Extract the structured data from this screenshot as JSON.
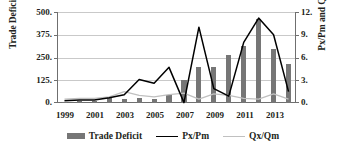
{
  "chart_data": {
    "type": "bar",
    "title": "",
    "xlabel": "",
    "ylabel": "Trade Deficit",
    "y2label": "Px/Pm and Qx/Qm",
    "ylim": [
      0,
      500
    ],
    "y2lim": [
      0,
      12
    ],
    "grid": true,
    "legend_position": "bottom",
    "categories": [
      "1999",
      "2000",
      "2001",
      "2002",
      "2003",
      "2004",
      "2005",
      "2006",
      "2007",
      "2008",
      "2009",
      "2010",
      "2011",
      "2012",
      "2013",
      "2014"
    ],
    "x_tick_labels": [
      "1999",
      "2001",
      "2003",
      "2005",
      "2007",
      "2009",
      "2011",
      "2013"
    ],
    "y_tick_labels": [
      "0.",
      "125.",
      "250.",
      "375.",
      "500."
    ],
    "y_tick_values": [
      0,
      125,
      250,
      375,
      500
    ],
    "y2_tick_labels": [
      "0.",
      "3.",
      "6.",
      "9.",
      "12."
    ],
    "y2_tick_values": [
      0,
      3,
      6,
      9,
      12
    ],
    "series": [
      {
        "name": "Trade Deficit",
        "kind": "bar",
        "axis": "left",
        "color": "#767676",
        "values": [
          8,
          10,
          12,
          30,
          22,
          30,
          22,
          42,
          125,
          200,
          200,
          262,
          312,
          462,
          295,
          215
        ]
      },
      {
        "name": "Px/Pm",
        "kind": "line",
        "axis": "right",
        "color": "#000000",
        "values": [
          0.3,
          0.4,
          0.4,
          0.7,
          1.1,
          3.1,
          2.6,
          4.7,
          0.05,
          10.0,
          1.9,
          0.9,
          8.0,
          11.2,
          9.0,
          1.5
        ]
      },
      {
        "name": "Qx/Qm",
        "kind": "line",
        "axis": "right",
        "color": "#c0c0c0",
        "values": [
          0.5,
          0.6,
          0.6,
          0.8,
          1.5,
          1.0,
          0.8,
          1.1,
          1.3,
          0.5,
          1.2,
          1.0,
          0.6,
          0.5,
          1.2,
          0.5
        ]
      }
    ]
  },
  "legend": {
    "items": [
      {
        "label": "Trade Deficit",
        "marker": "bar-swatch",
        "color": "#767676"
      },
      {
        "label": "Px/Pm",
        "marker": "line-swatch",
        "color": "#000000"
      },
      {
        "label": "Qx/Qm",
        "marker": "line-swatch-light",
        "color": "#c0c0c0"
      }
    ]
  }
}
